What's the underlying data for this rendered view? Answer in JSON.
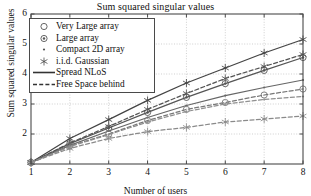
{
  "chart_data": {
    "type": "line",
    "title": "Sum squared singular values",
    "xlabel": "Number of users",
    "ylabel": "Sum squared singular values",
    "xlim": [
      1,
      8
    ],
    "ylim": [
      1,
      6
    ],
    "xticks": [
      "1",
      "2",
      "3",
      "4",
      "5",
      "6",
      "7",
      "8"
    ],
    "yticks": [
      "2",
      "3",
      "4",
      "5",
      "6"
    ],
    "grid": true,
    "legend_position": "upper left",
    "x": [
      1,
      2,
      3,
      4,
      5,
      6,
      7,
      8
    ],
    "series": [
      {
        "name": "i.i.d. Gaussian, Spread NLoS",
        "marker": "hexagram",
        "linestyle": "solid",
        "color": "#444444",
        "values": [
          1.05,
          1.85,
          2.48,
          3.12,
          3.7,
          4.2,
          4.7,
          5.15
        ]
      },
      {
        "name": "Large array, Spread NLoS",
        "marker": "circle-dot",
        "linestyle": "solid",
        "color": "#555555",
        "values": [
          1.05,
          1.68,
          2.2,
          2.72,
          3.22,
          3.68,
          4.12,
          4.55
        ]
      },
      {
        "name": "i.i.d. Gaussian, Free Space behind",
        "marker": "hexagram",
        "linestyle": "dashed",
        "color": "#555555",
        "values": [
          1.05,
          1.7,
          2.25,
          2.82,
          3.35,
          3.85,
          4.25,
          4.65
        ]
      },
      {
        "name": "Compact 2D array, Spread NLoS",
        "marker": "dot",
        "linestyle": "solid",
        "color": "#666666",
        "values": [
          1.05,
          1.62,
          2.1,
          2.55,
          2.95,
          3.28,
          3.55,
          3.8
        ]
      },
      {
        "name": "Very Large array, Free Space behind",
        "marker": "circle",
        "linestyle": "dashed",
        "color": "#777777",
        "values": [
          1.05,
          1.6,
          2.0,
          2.45,
          2.82,
          3.05,
          3.3,
          3.5
        ]
      },
      {
        "name": "Compact 2D array, Free Space behind",
        "marker": "dot",
        "linestyle": "dashed",
        "color": "#909090",
        "values": [
          1.05,
          1.58,
          1.98,
          2.4,
          2.75,
          3.0,
          3.15,
          3.25
        ]
      },
      {
        "name": "Very Large array, Free Space behind low",
        "marker": "hexagram",
        "linestyle": "dashed",
        "color": "#8a8a8a",
        "values": [
          1.05,
          1.52,
          1.85,
          2.08,
          2.22,
          2.4,
          2.5,
          2.6
        ]
      }
    ],
    "legend": [
      {
        "label": "Very Large array",
        "key": "circle-marker",
        "marker": "circle",
        "linestyle": "none"
      },
      {
        "label": "Large array",
        "key": "circle-dot-marker",
        "marker": "circle-dot",
        "linestyle": "none"
      },
      {
        "label": "Compact 2D array",
        "key": "dot-marker",
        "marker": "dot",
        "linestyle": "none"
      },
      {
        "label": "i.i.d. Gaussian",
        "key": "hexagram-marker",
        "marker": "hexagram",
        "linestyle": "none"
      },
      {
        "label": "Spread NLoS",
        "key": "solid-line",
        "marker": "none",
        "linestyle": "solid"
      },
      {
        "label": "Free Space behind",
        "key": "dashed-line",
        "marker": "none",
        "linestyle": "dashed"
      }
    ]
  },
  "colors": {
    "axis": "#4a4a4a",
    "grid": "#bcbcbc",
    "text": "#111111",
    "background": "#ffffff"
  }
}
